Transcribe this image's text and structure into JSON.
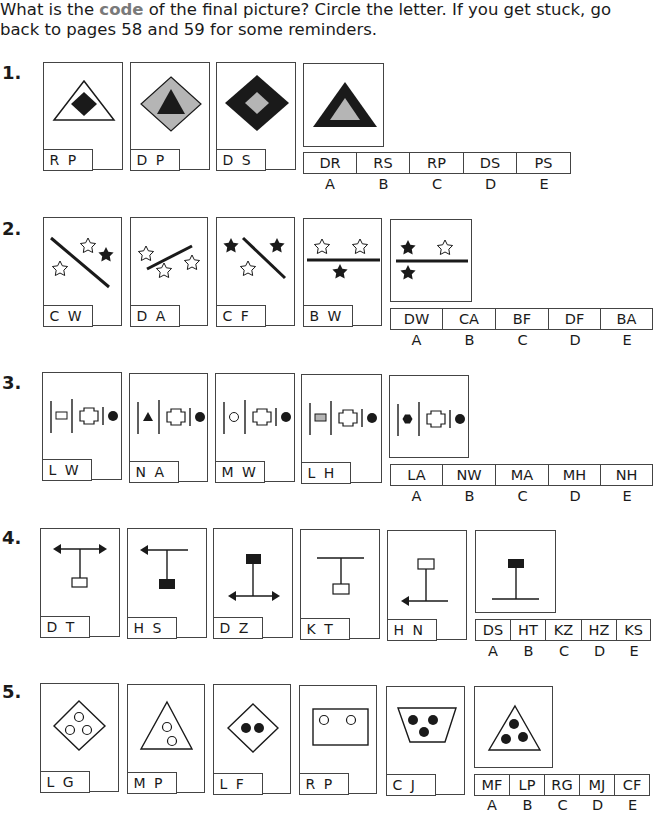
{
  "instructions": {
    "before": "What is the ",
    "highlight": "code",
    "after": " of the final picture? Circle the letter. If you get stuck, go back to pages 58 and 59 for some reminders."
  },
  "questions": [
    {
      "number": "1.",
      "example_codes": [
        "R P",
        "D P",
        "D S"
      ],
      "example_figures": [
        "white triangle with black diamond inside",
        "grey diamond with black triangle inside",
        "black diamond with grey diamond inside"
      ],
      "final_figure": "black triangle with grey triangle inside",
      "options": [
        "DR",
        "RS",
        "RP",
        "DS",
        "PS"
      ],
      "option_letters": [
        "A",
        "B",
        "C",
        "D",
        "E"
      ]
    },
    {
      "number": "2.",
      "example_codes": [
        "C W",
        "D A",
        "C F",
        "B W"
      ],
      "example_figures": [
        "diagonal line, two white stars one black star",
        "rising line, three white stars",
        "diagonal line, two black stars one white star",
        "horizontal line, two white stars above one black star below"
      ],
      "final_figure": "horizontal line, black and white star above, black star below",
      "options": [
        "DW",
        "CA",
        "BF",
        "DF",
        "BA"
      ],
      "option_letters": [
        "A",
        "B",
        "C",
        "D",
        "E"
      ]
    },
    {
      "number": "3.",
      "example_codes": [
        "L W",
        "N A",
        "M W",
        "L H"
      ],
      "example_figures": [
        "white rectangle",
        "black triangle",
        "white circle",
        "grey rectangle"
      ],
      "final_figure": "black hexagon",
      "options": [
        "LA",
        "NW",
        "MA",
        "MH",
        "NH"
      ],
      "option_letters": [
        "A",
        "B",
        "C",
        "D",
        "E"
      ]
    },
    {
      "number": "4.",
      "example_codes": [
        "D T",
        "H S",
        "D Z",
        "K T",
        "H N"
      ],
      "example_figures": [
        "double arrow top, white box bottom",
        "left arrow top, black box bottom",
        "black box top, double arrow bottom",
        "plain line top, white box bottom",
        "white box top, left arrow bottom"
      ],
      "final_figure": "black box top, plain line bottom",
      "options": [
        "DS",
        "HT",
        "KZ",
        "HZ",
        "KS"
      ],
      "option_letters": [
        "A",
        "B",
        "C",
        "D",
        "E"
      ]
    },
    {
      "number": "5.",
      "example_codes": [
        "L G",
        "M P",
        "L F",
        "R P",
        "C J"
      ],
      "example_figures": [
        "diamond three white circles",
        "triangle two white circles",
        "diamond two black circles",
        "rectangle two white circles",
        "trapezium three black circles"
      ],
      "final_figure": "triangle three black circles",
      "options": [
        "MF",
        "LP",
        "RG",
        "MJ",
        "CF"
      ],
      "option_letters": [
        "A",
        "B",
        "C",
        "D",
        "E"
      ]
    }
  ],
  "colors": {
    "ink": "#1a1a1a",
    "grey_fill": "#b5b5b5",
    "highlight": "#7a7a7a",
    "border": "#444444"
  }
}
